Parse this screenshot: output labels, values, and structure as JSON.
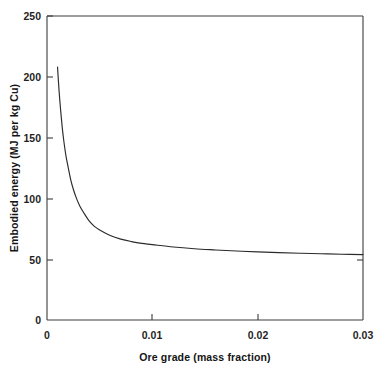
{
  "figure": {
    "background_color": "#ffffff",
    "line_color": "#2b2b2b",
    "axis_color": "#3c3c3c",
    "text_color": "#1a1a1a"
  },
  "chart_data": {
    "type": "line",
    "title": "",
    "subtitle": "",
    "xlabel": "Ore grade (mass fraction)",
    "ylabel": "Embodied energy (MJ per kg Cu)",
    "xlim": [
      0,
      0.03
    ],
    "ylim": [
      0,
      250
    ],
    "xticks": [
      0,
      0.01,
      0.02,
      0.03
    ],
    "xtick_labels": [
      "0",
      "0.01",
      "0.02",
      "0.03"
    ],
    "yticks": [
      0,
      50,
      100,
      150,
      200,
      250
    ],
    "ytick_labels": [
      "0",
      "50",
      "100",
      "150",
      "200",
      "250"
    ],
    "grid": false,
    "legend": false,
    "legend_position": "none",
    "annotations": [],
    "series": [
      {
        "name": "Embodied energy vs ore grade",
        "color": "#2b2b2b",
        "x": [
          0.001,
          0.00115,
          0.0013,
          0.00145,
          0.0016,
          0.0018,
          0.002,
          0.00225,
          0.0025,
          0.0028,
          0.0031,
          0.0035,
          0.004,
          0.0045,
          0.005,
          0.006,
          0.007,
          0.008,
          0.009,
          0.01,
          0.012,
          0.014,
          0.016,
          0.018,
          0.02,
          0.022,
          0.024,
          0.026,
          0.028,
          0.03
        ],
        "y": [
          208.0,
          188.0,
          172.0,
          158.0,
          147.0,
          135.0,
          126.0,
          115.5,
          107.5,
          100.0,
          94.0,
          88.0,
          81.5,
          77.0,
          74.0,
          69.5,
          66.5,
          64.5,
          63.0,
          62.0,
          60.0,
          58.6,
          57.6,
          56.7,
          56.0,
          55.4,
          54.9,
          54.5,
          54.1,
          53.8
        ]
      }
    ]
  }
}
